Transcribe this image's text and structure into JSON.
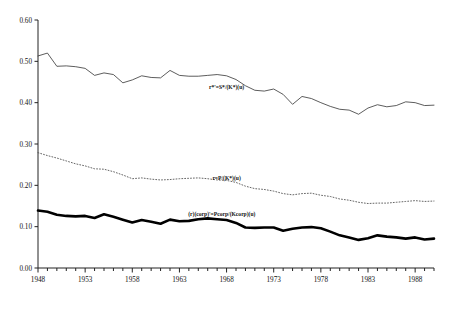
{
  "chart_data": {
    "type": "line",
    "title": "",
    "subtitle": "",
    "xlabel": "",
    "ylabel": "",
    "xlim": [
      1948,
      1990
    ],
    "ylim": [
      0.0,
      0.6
    ],
    "grid": false,
    "legend_position": "inline-annotations",
    "x_tick_labels": [
      "1948",
      "1953",
      "1958",
      "1963",
      "1968",
      "1973",
      "1978",
      "1983",
      "1988"
    ],
    "x_tick_values": [
      1948,
      1953,
      1958,
      1963,
      1968,
      1973,
      1978,
      1983,
      1988
    ],
    "x_minor_tick_interval": 1,
    "y_tick_labels": [
      "0.00",
      "0.10",
      "0.20",
      "0.30",
      "0.40",
      "0.50",
      "0.60"
    ],
    "y_tick_values": [
      0.0,
      0.1,
      0.2,
      0.3,
      0.4,
      0.5,
      0.6
    ],
    "x": [
      1948,
      1949,
      1950,
      1951,
      1952,
      1953,
      1954,
      1955,
      1956,
      1957,
      1958,
      1959,
      1960,
      1961,
      1962,
      1963,
      1964,
      1965,
      1966,
      1967,
      1968,
      1969,
      1970,
      1971,
      1972,
      1973,
      1974,
      1975,
      1976,
      1977,
      1978,
      1979,
      1980,
      1981,
      1982,
      1983,
      1984,
      1985,
      1986,
      1987,
      1988,
      1989,
      1990
    ],
    "series": [
      {
        "name": "r*'=S*/(K*)(u)",
        "style": "thin-solid",
        "color": "#333333",
        "line_width": 0.8,
        "label": "r*'=S*/(K*)(u)",
        "label_x": 1968.0,
        "label_y": 0.432,
        "values": [
          0.513,
          0.52,
          0.488,
          0.489,
          0.487,
          0.483,
          0.466,
          0.472,
          0.468,
          0.448,
          0.455,
          0.465,
          0.461,
          0.46,
          0.478,
          0.466,
          0.464,
          0.464,
          0.466,
          0.468,
          0.465,
          0.456,
          0.441,
          0.43,
          0.428,
          0.433,
          0.42,
          0.396,
          0.415,
          0.41,
          0.4,
          0.391,
          0.384,
          0.382,
          0.372,
          0.387,
          0.395,
          0.39,
          0.393,
          0.402,
          0.4,
          0.393,
          0.394
        ]
      },
      {
        "name": "r=P/(K*)(u)",
        "style": "dotted",
        "color": "#555555",
        "line_width": 0.9,
        "label": "r=P/(K*)(u)",
        "label_x": 1968.0,
        "label_y": 0.213,
        "values": [
          0.279,
          0.272,
          0.266,
          0.259,
          0.252,
          0.247,
          0.24,
          0.239,
          0.233,
          0.225,
          0.216,
          0.218,
          0.215,
          0.213,
          0.214,
          0.216,
          0.217,
          0.218,
          0.216,
          0.213,
          0.212,
          0.207,
          0.198,
          0.192,
          0.19,
          0.186,
          0.18,
          0.177,
          0.18,
          0.181,
          0.176,
          0.173,
          0.167,
          0.164,
          0.159,
          0.156,
          0.157,
          0.157,
          0.159,
          0.161,
          0.163,
          0.161,
          0.162
        ]
      },
      {
        "name": "(r)(corp)'=Pcorp/(Kcorp)(u)",
        "style": "bold-solid",
        "color": "#000000",
        "line_width": 2.6,
        "label": "(r)(corp)'=Pcorp/(Kcorp)(u)",
        "label_x": 1967.5,
        "label_y": 0.127,
        "values": [
          0.139,
          0.136,
          0.129,
          0.126,
          0.125,
          0.126,
          0.121,
          0.13,
          0.124,
          0.117,
          0.11,
          0.116,
          0.112,
          0.107,
          0.117,
          0.113,
          0.114,
          0.118,
          0.12,
          0.118,
          0.116,
          0.109,
          0.098,
          0.097,
          0.098,
          0.098,
          0.09,
          0.095,
          0.098,
          0.099,
          0.096,
          0.088,
          0.079,
          0.074,
          0.068,
          0.072,
          0.079,
          0.076,
          0.074,
          0.071,
          0.074,
          0.069,
          0.071
        ]
      }
    ]
  },
  "axes": {
    "y_axis_name": "y-axis",
    "x_axis_name": "x-axis"
  }
}
